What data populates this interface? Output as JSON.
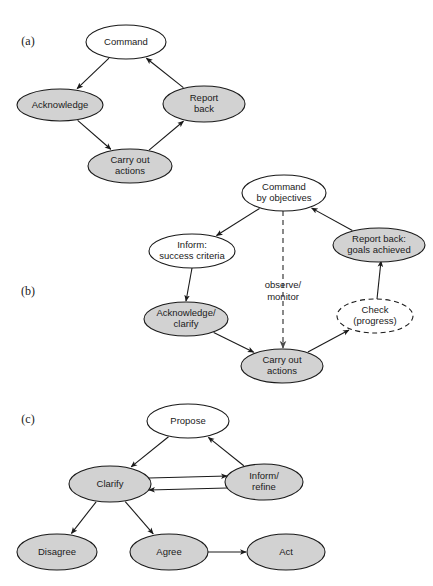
{
  "figure": {
    "background_color": "#ffffff",
    "node_fill_shaded": "#d2d2d2",
    "node_fill_open": "#ffffff",
    "stroke_color": "#1a1a1a"
  },
  "panels": [
    {
      "id": "a",
      "label": "(a)",
      "label_x": 28,
      "label_y": 42,
      "nodes": [
        {
          "id": "a-command",
          "text_lines": [
            "Command"
          ],
          "cx": 126,
          "cy": 42,
          "rx": 40,
          "ry": 17,
          "style": "open"
        },
        {
          "id": "a-acknowledge",
          "text_lines": [
            "Acknowledge"
          ],
          "cx": 60,
          "cy": 105,
          "rx": 43,
          "ry": 16,
          "style": "filled"
        },
        {
          "id": "a-report",
          "text_lines": [
            "Report",
            "back"
          ],
          "cx": 204,
          "cy": 104,
          "rx": 41,
          "ry": 18,
          "style": "filled"
        },
        {
          "id": "a-carry",
          "text_lines": [
            "Carry out",
            "actions"
          ],
          "cx": 130,
          "cy": 166,
          "rx": 42,
          "ry": 17,
          "style": "filled"
        }
      ],
      "edges": [
        {
          "id": "a-e1",
          "from": "a-command",
          "to": "a-acknowledge",
          "style": "solid",
          "label": ""
        },
        {
          "id": "a-e2",
          "from": "a-acknowledge",
          "to": "a-carry",
          "style": "solid",
          "label": ""
        },
        {
          "id": "a-e3",
          "from": "a-carry",
          "to": "a-report",
          "style": "solid",
          "label": ""
        },
        {
          "id": "a-e4",
          "from": "a-report",
          "to": "a-command",
          "style": "solid",
          "label": ""
        }
      ]
    },
    {
      "id": "b",
      "label": "(b)",
      "label_x": 28,
      "label_y": 292,
      "nodes": [
        {
          "id": "b-command",
          "text_lines": [
            "Command",
            "by objectives"
          ],
          "cx": 284,
          "cy": 193,
          "rx": 42,
          "ry": 18,
          "style": "open"
        },
        {
          "id": "b-inform",
          "text_lines": [
            "Inform:",
            "success criteria"
          ],
          "cx": 192,
          "cy": 251,
          "rx": 43,
          "ry": 17,
          "style": "open"
        },
        {
          "id": "b-report",
          "text_lines": [
            "Report back:",
            "goals achieved"
          ],
          "cx": 379,
          "cy": 245,
          "rx": 46,
          "ry": 17,
          "style": "filled"
        },
        {
          "id": "b-acknow",
          "text_lines": [
            "Acknowledge/",
            "clarify"
          ],
          "cx": 186,
          "cy": 319,
          "rx": 42,
          "ry": 17,
          "style": "filled"
        },
        {
          "id": "b-check",
          "text_lines": [
            "Check",
            "(progress)"
          ],
          "cx": 375,
          "cy": 316,
          "rx": 38,
          "ry": 17,
          "style": "dashed"
        },
        {
          "id": "b-carry",
          "text_lines": [
            "Carry out",
            "actions"
          ],
          "cx": 282,
          "cy": 366,
          "rx": 41,
          "ry": 17,
          "style": "filled"
        }
      ],
      "edges": [
        {
          "id": "b-e1",
          "from": "b-command",
          "to": "b-inform",
          "style": "solid",
          "label": ""
        },
        {
          "id": "b-e2",
          "from": "b-inform",
          "to": "b-acknow",
          "style": "solid",
          "label": ""
        },
        {
          "id": "b-e3",
          "from": "b-acknow",
          "to": "b-carry",
          "style": "solid",
          "label": ""
        },
        {
          "id": "b-e4",
          "from": "b-carry",
          "to": "b-check",
          "style": "solid",
          "label": ""
        },
        {
          "id": "b-e5",
          "from": "b-check",
          "to": "b-report",
          "style": "solid",
          "label": ""
        },
        {
          "id": "b-e6",
          "from": "b-report",
          "to": "b-command",
          "style": "solid",
          "label": ""
        },
        {
          "id": "b-e7",
          "from": "b-command",
          "to": "b-carry",
          "style": "dashed",
          "label": "observe/\nmonitor",
          "label_lines": [
            "observe/",
            "monitor"
          ],
          "label_x": 283,
          "label_y": 285
        }
      ]
    },
    {
      "id": "c",
      "label": "(c)",
      "label_x": 28,
      "label_y": 420,
      "nodes": [
        {
          "id": "c-propose",
          "text_lines": [
            "Propose"
          ],
          "cx": 188,
          "cy": 421,
          "rx": 41,
          "ry": 17,
          "style": "open"
        },
        {
          "id": "c-clarify",
          "text_lines": [
            "Clarify"
          ],
          "cx": 110,
          "cy": 484,
          "rx": 41,
          "ry": 18,
          "style": "filled"
        },
        {
          "id": "c-inform",
          "text_lines": [
            "Inform/",
            "refine"
          ],
          "cx": 264,
          "cy": 482,
          "rx": 39,
          "ry": 18,
          "style": "filled"
        },
        {
          "id": "c-disagree",
          "text_lines": [
            "Disagree"
          ],
          "cx": 57,
          "cy": 552,
          "rx": 40,
          "ry": 18,
          "style": "filled"
        },
        {
          "id": "c-agree",
          "text_lines": [
            "Agree"
          ],
          "cx": 169,
          "cy": 552,
          "rx": 39,
          "ry": 18,
          "style": "filled"
        },
        {
          "id": "c-act",
          "text_lines": [
            "Act"
          ],
          "cx": 286,
          "cy": 552,
          "rx": 39,
          "ry": 18,
          "style": "filled"
        }
      ],
      "edges": [
        {
          "id": "c-e1",
          "from": "c-propose",
          "to": "c-clarify",
          "style": "solid",
          "label": ""
        },
        {
          "id": "c-e2",
          "from": "c-inform",
          "to": "c-propose",
          "style": "solid",
          "label": ""
        },
        {
          "id": "c-e3",
          "from": "c-clarify",
          "to": "c-inform",
          "style": "solid",
          "label": ""
        },
        {
          "id": "c-e4",
          "from": "c-inform",
          "to": "c-clarify",
          "style": "solid",
          "label": ""
        },
        {
          "id": "c-e5",
          "from": "c-clarify",
          "to": "c-disagree",
          "style": "solid",
          "label": ""
        },
        {
          "id": "c-e6",
          "from": "c-clarify",
          "to": "c-agree",
          "style": "solid",
          "label": ""
        },
        {
          "id": "c-e7",
          "from": "c-agree",
          "to": "c-act",
          "style": "solid",
          "label": ""
        }
      ]
    }
  ]
}
